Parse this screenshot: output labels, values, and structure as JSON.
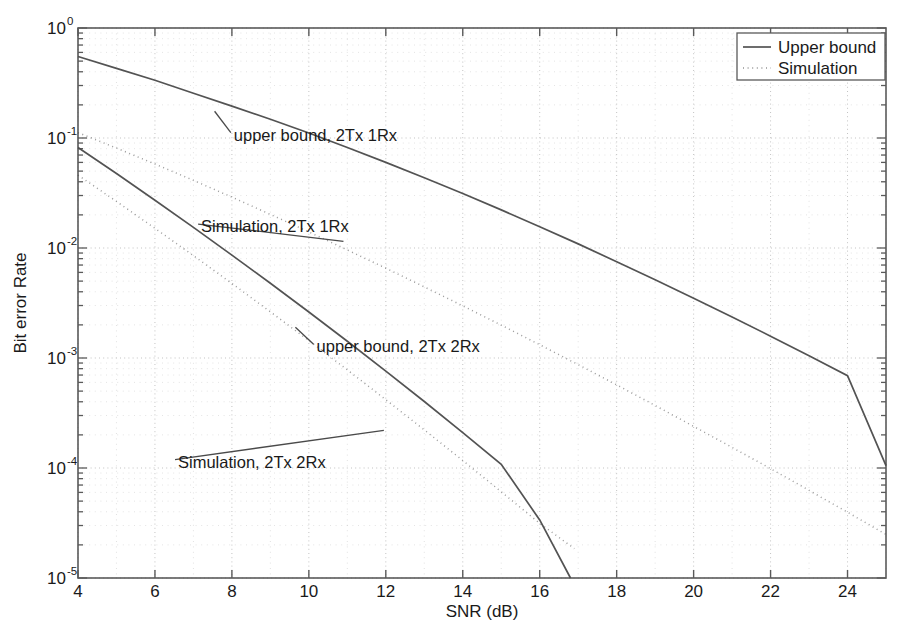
{
  "figure": {
    "background_color": "#ffffff",
    "axes_color": "#5a5a5a",
    "curve_color": "#4a4a4a",
    "grid_color": "#b9b9b9"
  },
  "chart_data": {
    "type": "line",
    "title": "",
    "xlabel": "SNR (dB)",
    "ylabel": "Bit error Rate",
    "xlim": [
      4,
      25
    ],
    "ylim": [
      1e-05,
      1
    ],
    "yscale": "log",
    "xscale": "linear",
    "grid": true,
    "grid_style": "dotted",
    "xticks": [
      4,
      6,
      8,
      10,
      12,
      14,
      16,
      18,
      20,
      22,
      24
    ],
    "xtick_labels": [
      "4",
      "6",
      "8",
      "10",
      "12",
      "14",
      "16",
      "18",
      "20",
      "22",
      "24"
    ],
    "yticks": [
      1,
      0.1,
      0.01,
      0.001,
      0.0001,
      1e-05
    ],
    "ytick_labels": [
      "10^0",
      "10^-1",
      "10^-2",
      "10^-3",
      "10^-4",
      "10^-5"
    ],
    "ytick_mantissas": [
      "10",
      "10",
      "10",
      "10",
      "10",
      "10"
    ],
    "ytick_exponents": [
      "0",
      "-1",
      "-2",
      "-3",
      "-4",
      "-5"
    ],
    "legend": {
      "position": "upper right",
      "entries": [
        {
          "label": "Upper bound",
          "style": "solid"
        },
        {
          "label": "Simulation",
          "style": "dotted"
        }
      ]
    },
    "annotations": [
      {
        "text": "upper bound, 2Tx 1Rx",
        "x": 8.05,
        "y": 0.105,
        "leader_from_x": 7.55,
        "leader_from_y": 0.175
      },
      {
        "text": "Simulation, 2Tx 1Rx",
        "x": 7.2,
        "y": 0.0155,
        "leader_from_x": 10.9,
        "leader_from_y": 0.0115
      },
      {
        "text": "upper bound, 2Tx 2Rx",
        "x": 10.2,
        "y": 0.00125,
        "leader_from_x": 9.65,
        "leader_from_y": 0.0019
      },
      {
        "text": "Simulation, 2Tx 2Rx",
        "x": 6.6,
        "y": 0.000112,
        "leader_from_x": 11.95,
        "leader_from_y": 0.00022
      }
    ],
    "series": [
      {
        "name": "upper bound, 2Tx 1Rx",
        "style": "solid",
        "x": [
          4,
          5,
          6,
          7,
          8,
          9,
          10,
          11,
          12,
          13,
          14,
          15,
          16,
          17,
          18,
          19,
          20,
          21,
          22,
          23,
          24,
          25
        ],
        "y": [
          0.55,
          0.43,
          0.335,
          0.255,
          0.195,
          0.148,
          0.111,
          0.082,
          0.06,
          0.0435,
          0.0313,
          0.0222,
          0.0156,
          0.0109,
          0.0075,
          0.00515,
          0.0035,
          0.00236,
          0.00158,
          0.00105,
          0.00069,
          0.000105
        ]
      },
      {
        "name": "Simulation, 2Tx 1Rx",
        "style": "dotted",
        "x": [
          4,
          5,
          6,
          7,
          8,
          9,
          10,
          11,
          12,
          13,
          14,
          15,
          16,
          17,
          18,
          19,
          20,
          21,
          22,
          23,
          24,
          25
        ],
        "y": [
          0.112,
          0.081,
          0.058,
          0.0412,
          0.029,
          0.0202,
          0.014,
          0.0096,
          0.00655,
          0.00443,
          0.00298,
          0.00199,
          0.00132,
          0.00087,
          0.00057,
          0.00037,
          0.000239,
          0.000154,
          9.85e-05,
          6.26e-05,
          3.96e-05,
          2.49e-05
        ]
      },
      {
        "name": "upper bound, 2Tx 2Rx",
        "style": "solid",
        "x": [
          4,
          5,
          6,
          7,
          8,
          9,
          10,
          11,
          12,
          13,
          14,
          15,
          16,
          16.8
        ],
        "y": [
          0.082,
          0.0475,
          0.0272,
          0.0154,
          0.00862,
          0.00478,
          0.00262,
          0.00142,
          0.00076,
          0.000402,
          0.00021,
          0.000108,
          3.37e-05,
          1e-05
        ]
      },
      {
        "name": "Simulation, 2Tx 2Rx",
        "style": "dotted",
        "x": [
          4,
          5,
          6,
          7,
          8,
          9,
          10,
          11,
          12,
          13,
          14,
          15,
          16,
          16.9
        ],
        "y": [
          0.046,
          0.0265,
          0.0151,
          0.00852,
          0.00476,
          0.00263,
          0.00144,
          0.00078,
          0.000418,
          0.000222,
          0.000117,
          6.08e-05,
          3.14e-05,
          1.85e-05
        ]
      }
    ]
  }
}
